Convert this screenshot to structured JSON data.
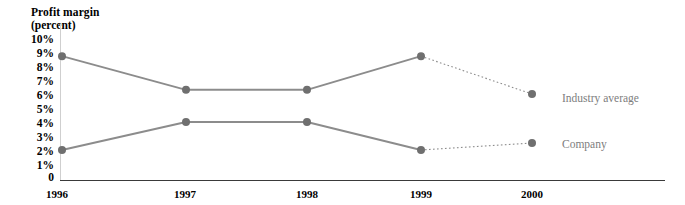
{
  "chart_data": {
    "type": "line",
    "title": "Profit margin",
    "subtitle": "(percent)",
    "xlabel": "",
    "ylabel": "Profit margin (percent)",
    "categories": [
      "1996",
      "1997",
      "1998",
      "1999",
      "2000"
    ],
    "ytick_labels": [
      "10%",
      "9%",
      "8%",
      "7%",
      "6%",
      "5%",
      "4%",
      "3%",
      "2%",
      "1%",
      "0"
    ],
    "ytick_values": [
      10,
      9,
      8,
      7,
      6,
      5,
      4,
      3,
      2,
      1,
      0
    ],
    "ylim": [
      0,
      10
    ],
    "grid": false,
    "legend_position": "right-inline",
    "series": [
      {
        "name": "Industry average",
        "values": [
          8.7,
          6.3,
          6.3,
          8.7,
          6.0
        ],
        "color": "#8c8c8c",
        "last_segment_style": "dotted"
      },
      {
        "name": "Company",
        "values": [
          2.0,
          4.0,
          4.0,
          2.0,
          2.5
        ],
        "color": "#8c8c8c",
        "last_segment_style": "dotted"
      }
    ]
  },
  "legend": {
    "industry_label": "Industry average",
    "company_label": "Company"
  },
  "colors": {
    "line": "#8c8c8c",
    "marker": "#6f6f6f",
    "axis": "#3a3a3a",
    "label_text": "#7d7d7d"
  }
}
